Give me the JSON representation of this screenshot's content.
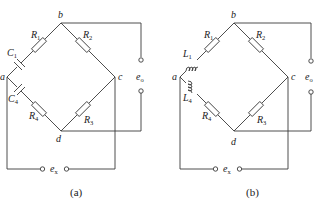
{
  "figure": {
    "panels": [
      {
        "id": "a",
        "caption": "(a)",
        "nodes": {
          "a": "a",
          "b": "b",
          "c": "c",
          "d": "d"
        },
        "components": {
          "R1": {
            "sym": "R",
            "sub": "1"
          },
          "R2": {
            "sym": "R",
            "sub": "2"
          },
          "R3": {
            "sym": "R",
            "sub": "3"
          },
          "R4": {
            "sym": "R",
            "sub": "4"
          },
          "X1": {
            "sym": "C",
            "sub": "1",
            "type": "capacitor"
          },
          "X4": {
            "sym": "C",
            "sub": "4",
            "type": "capacitor"
          }
        },
        "output": {
          "sym": "e",
          "sub": "o"
        },
        "input": {
          "sym": "e",
          "sub": "x"
        }
      },
      {
        "id": "b",
        "caption": "(b)",
        "nodes": {
          "a": "a",
          "b": "b",
          "c": "c",
          "d": "d"
        },
        "components": {
          "R1": {
            "sym": "R",
            "sub": "1"
          },
          "R2": {
            "sym": "R",
            "sub": "2"
          },
          "R3": {
            "sym": "R",
            "sub": "3"
          },
          "R4": {
            "sym": "R",
            "sub": "4"
          },
          "X1": {
            "sym": "L",
            "sub": "1",
            "type": "inductor"
          },
          "X4": {
            "sym": "L",
            "sub": "4",
            "type": "inductor"
          }
        },
        "output": {
          "sym": "e",
          "sub": "o"
        },
        "input": {
          "sym": "e",
          "sub": "x"
        }
      }
    ]
  }
}
